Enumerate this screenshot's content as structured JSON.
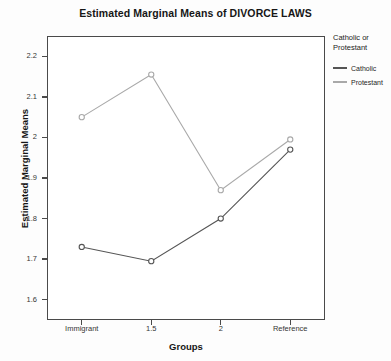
{
  "chart_data": {
    "type": "line",
    "title": "Estimated Marginal Means of DIVORCE LAWS",
    "xlabel": "Groups",
    "ylabel": "Estimated Marginal Means",
    "categories": [
      "Immigrant",
      "1.5",
      "2",
      "Reference"
    ],
    "series": [
      {
        "name": "Catholic",
        "color": "#555555",
        "marker": "open-circle",
        "values": [
          1.73,
          1.695,
          1.8,
          1.97
        ]
      },
      {
        "name": "Protestant",
        "color": "#a9a9a9",
        "marker": "open-circle",
        "values": [
          2.05,
          2.155,
          1.87,
          1.995
        ]
      }
    ],
    "ylim": [
      1.55,
      2.25
    ],
    "yticks": [
      1.6,
      1.7,
      1.8,
      1.9,
      2.0,
      2.1,
      2.2
    ],
    "ytick_labels": [
      "1.6",
      "1.7",
      "1.8",
      "1.9",
      "2",
      "2.1",
      "2.2"
    ],
    "grid": false,
    "legend_position": "right",
    "legend_title": "Catholic or Protestant"
  },
  "legend": {
    "title_line1": "Catholic or",
    "title_line2": "Protestant",
    "entries": [
      {
        "label": "Catholic",
        "color": "#555555"
      },
      {
        "label": "Protestant",
        "color": "#a9a9a9"
      }
    ]
  }
}
